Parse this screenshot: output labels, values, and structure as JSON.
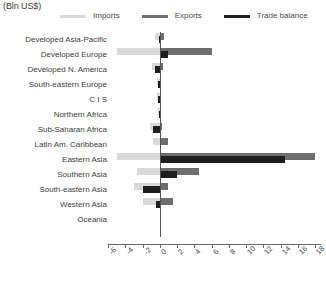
{
  "units_caption": "(Bln US$)",
  "legend": {
    "items": [
      {
        "label": "Imports",
        "color": "#d9d9d9",
        "key": "imports"
      },
      {
        "label": "Exports",
        "color": "#6e6e6e",
        "key": "exports"
      },
      {
        "label": "Trade balance",
        "color": "#1f1f1f",
        "key": "balance"
      }
    ]
  },
  "colors": {
    "imports": "#d9d9d9",
    "exports": "#6e6e6e",
    "balance": "#1f1f1f",
    "axis": "#6a6a6a",
    "zero_line": "#555555",
    "text": "#3d3d3d",
    "background": "#ffffff"
  },
  "axis": {
    "ticks": [
      -6,
      -4,
      -2,
      0,
      2,
      4,
      6,
      8,
      10,
      12,
      14,
      16,
      18
    ],
    "tick_labels": [
      "-6",
      "-4",
      "-2",
      "0",
      "2",
      "4",
      "6",
      "8",
      "10",
      "12",
      "14",
      "16",
      "18"
    ],
    "min": -6,
    "max": 18,
    "step": 2,
    "zero_value": 0
  },
  "chart_data": {
    "type": "bar",
    "orientation": "horizontal",
    "title": "",
    "subtitle": "",
    "xlabel": "",
    "ylabel": "",
    "units": "(Bln US$)",
    "xlim": [
      -6,
      18
    ],
    "grid": false,
    "legend_position": "top",
    "categories": [
      "Developed Asia-Pacific",
      "Developed Europe",
      "Developed N. America",
      "South-eastern Europe",
      "C I S",
      "Northern Africa",
      "Sub-Saharan Africa",
      "Latin Am. Caribbean",
      "Eastern Asia",
      "Southern Asia",
      "South-eastern Asia",
      "Western Asia",
      "Oceania"
    ],
    "series": [
      {
        "name": "Imports",
        "key": "imports",
        "note": "plotted to the left of zero as negative magnitude",
        "values": [
          -0.5,
          -5.0,
          -0.9,
          -0.3,
          -0.35,
          -0.15,
          -1.1,
          -0.8,
          -5.0,
          -2.6,
          -3.0,
          -1.9,
          0.0
        ]
      },
      {
        "name": "Exports",
        "key": "exports",
        "note": "plotted to the right of zero",
        "values": [
          0.45,
          6.0,
          0.35,
          0.15,
          0.2,
          0.1,
          0.3,
          1.0,
          18.0,
          4.6,
          1.0,
          1.5,
          0.0
        ]
      },
      {
        "name": "Trade balance",
        "key": "balance",
        "note": "exports minus imports",
        "values": [
          -0.1,
          1.0,
          -0.6,
          -0.2,
          -0.2,
          -0.1,
          -0.8,
          0.2,
          14.5,
          2.0,
          -2.0,
          -0.4,
          0.0
        ]
      }
    ]
  }
}
